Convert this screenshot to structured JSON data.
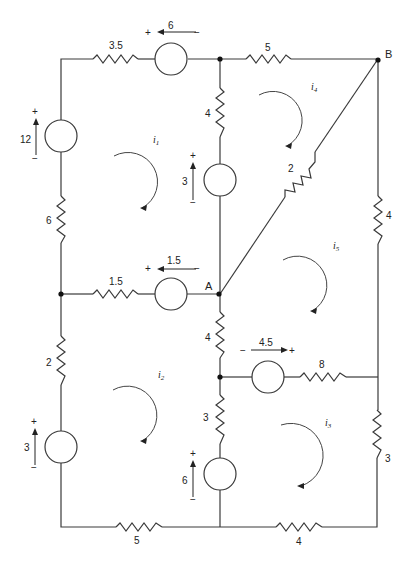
{
  "diagram": {
    "title": "",
    "type": "circuit-mesh-analysis",
    "nodes": {
      "A": {
        "label": "A"
      },
      "B": {
        "label": "B"
      }
    },
    "resistors": [
      {
        "id": "r-top-left",
        "value": "3.5"
      },
      {
        "id": "r-top-right",
        "value": "5"
      },
      {
        "id": "r-mid-upper",
        "value": "4"
      },
      {
        "id": "r-diagonal",
        "value": "2"
      },
      {
        "id": "r-right-upper",
        "value": "4"
      },
      {
        "id": "r-left-upper",
        "value": "6"
      },
      {
        "id": "r-mid-horiz",
        "value": "1.5"
      },
      {
        "id": "r-mid-lower",
        "value": "4"
      },
      {
        "id": "r-horiz-lower",
        "value": "8"
      },
      {
        "id": "r-left-lower",
        "value": "2"
      },
      {
        "id": "r-mid-bottom",
        "value": "3"
      },
      {
        "id": "r-right-lower",
        "value": "3"
      },
      {
        "id": "r-bottom-left",
        "value": "5"
      },
      {
        "id": "r-bottom-right",
        "value": "4"
      }
    ],
    "sources": [
      {
        "id": "v-top",
        "value": "6",
        "plus": "+",
        "minus": "−"
      },
      {
        "id": "v-left-upper",
        "value": "12",
        "plus": "+",
        "minus": "−"
      },
      {
        "id": "v-mid-upper",
        "value": "3",
        "plus": "+",
        "minus": "−"
      },
      {
        "id": "v-mid-horiz",
        "value": "1.5",
        "plus": "+",
        "minus": "−"
      },
      {
        "id": "v-horiz-lower",
        "value": "4.5",
        "plus": "+",
        "minus": "−"
      },
      {
        "id": "v-left-lower",
        "value": "3",
        "plus": "+",
        "minus": "−"
      },
      {
        "id": "v-mid-bottom",
        "value": "6",
        "plus": "+",
        "minus": "−"
      }
    ],
    "mesh_currents": [
      {
        "id": "i1",
        "label": "i",
        "sub": "1"
      },
      {
        "id": "i2",
        "label": "i",
        "sub": "2"
      },
      {
        "id": "i3",
        "label": "i",
        "sub": "3"
      },
      {
        "id": "i4",
        "label": "i",
        "sub": "4"
      },
      {
        "id": "i5",
        "label": "i",
        "sub": "5"
      }
    ]
  }
}
